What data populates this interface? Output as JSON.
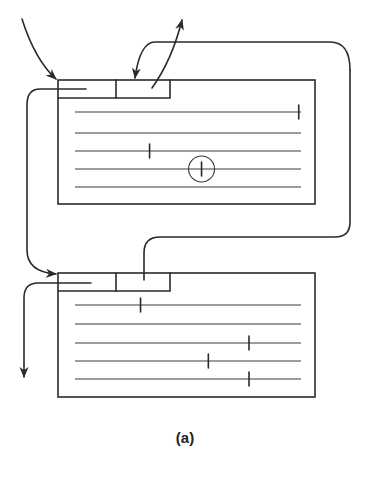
{
  "figure": {
    "caption": "(a)",
    "ink_color": "#2a2a2a",
    "background": "#ffffff"
  },
  "blocks": [
    {
      "name": "top-block",
      "line_count": 5,
      "marks": [
        {
          "line": 1,
          "position": 0.99,
          "circled": false
        },
        {
          "line": 3,
          "position": 0.33,
          "circled": false
        },
        {
          "line": 4,
          "position": 0.56,
          "circled": true
        }
      ]
    },
    {
      "name": "bottom-block",
      "line_count": 5,
      "marks": [
        {
          "line": 1,
          "position": 0.29,
          "circled": false
        },
        {
          "line": 3,
          "position": 0.77,
          "circled": false
        },
        {
          "line": 4,
          "position": 0.59,
          "circled": false
        },
        {
          "line": 5,
          "position": 0.77,
          "circled": false
        }
      ]
    }
  ]
}
